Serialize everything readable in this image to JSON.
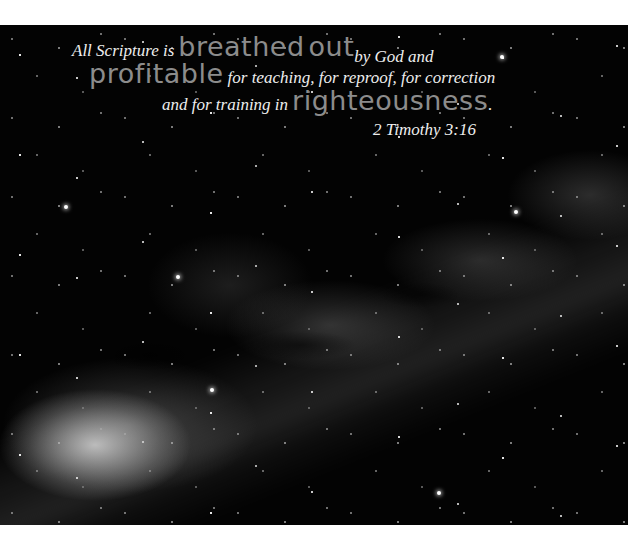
{
  "image": {
    "description": "Night sky photograph of the Milky Way with a Bible verse overlay",
    "colors": {
      "border": "#ffffff",
      "sky": "#030303",
      "verse_text": "#eeeeee",
      "emphasis_text": "#8c8c8c"
    }
  },
  "verse": {
    "line1": {
      "part1": "All Scripture is",
      "emphasis1": "breathed",
      "emphasis2": "out",
      "part2": "by God and"
    },
    "line2": {
      "emphasis": "profitable",
      "part": "for teaching, for reproof, for correction"
    },
    "line3": {
      "part": "and for training in",
      "emphasis": "righteousness",
      "period": "."
    },
    "reference": "2 Timothy 3:16"
  }
}
